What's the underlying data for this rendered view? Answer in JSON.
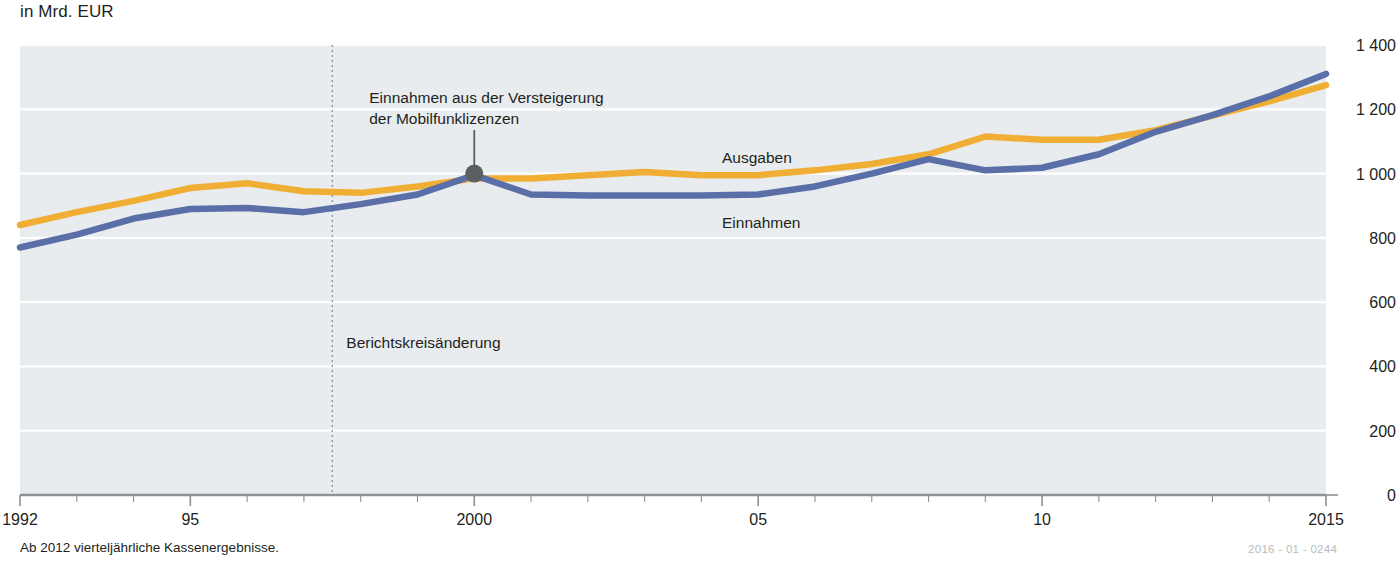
{
  "subtitle": "in Mrd. EUR",
  "footnote": "Ab 2012 vierteljährliche Kassenergebnisse.",
  "id_code": "2016 - 01 - 0244",
  "colors": {
    "ausgaben": "#f0ae35",
    "einnahmen": "#5a6fa8",
    "plot_background": "#e8ecee",
    "gridline": "#ffffff",
    "axis": "#8d9297",
    "marker": "#5b5f62",
    "break_line": "#8d9297"
  },
  "annotations": {
    "auction": {
      "line1": "Einnahmen aus der Versteigerung",
      "line2": "der Mobilfunklizenzen",
      "point_year": 2000,
      "point_value": 1000
    },
    "break": {
      "label": "Berichtskreisänderung",
      "year": 1997.5
    }
  },
  "series_labels": {
    "ausgaben": "Ausgaben",
    "einnahmen": "Einnahmen"
  },
  "chart_data": {
    "type": "line",
    "title": "",
    "subtitle": "in Mrd. EUR",
    "xlabel": "",
    "ylabel": "in Mrd. EUR",
    "xlim": [
      1992,
      2015
    ],
    "ylim": [
      0,
      1400
    ],
    "grid": true,
    "legend_position": "inline-labels",
    "x": [
      1992,
      1993,
      1994,
      1995,
      1996,
      1997,
      1998,
      1999,
      2000,
      2001,
      2002,
      2003,
      2004,
      2005,
      2006,
      2007,
      2008,
      2009,
      2010,
      2011,
      2012,
      2013,
      2014,
      2015
    ],
    "tick_labels_x": [
      "1992",
      "95",
      "2000",
      "05",
      "10",
      "2015"
    ],
    "tick_values_x": [
      1992,
      1995,
      2000,
      2005,
      2010,
      2015
    ],
    "tick_labels_y": [
      "0",
      "200",
      "400",
      "600",
      "800",
      "1 000",
      "1 200",
      "1 400"
    ],
    "tick_values_y": [
      0,
      200,
      400,
      600,
      800,
      1000,
      1200,
      1400
    ],
    "series": [
      {
        "name": "Ausgaben",
        "color": "#f0ae35",
        "values": [
          840,
          880,
          915,
          955,
          970,
          945,
          940,
          960,
          985,
          985,
          995,
          1005,
          995,
          995,
          1010,
          1030,
          1060,
          1115,
          1105,
          1105,
          1135,
          1180,
          1225,
          1275
        ]
      },
      {
        "name": "Einnahmen",
        "color": "#5a6fa8",
        "values": [
          770,
          810,
          860,
          890,
          893,
          880,
          905,
          935,
          995,
          935,
          932,
          932,
          932,
          935,
          960,
          1000,
          1045,
          1010,
          1018,
          1060,
          1130,
          1182,
          1240,
          1310
        ]
      }
    ]
  }
}
